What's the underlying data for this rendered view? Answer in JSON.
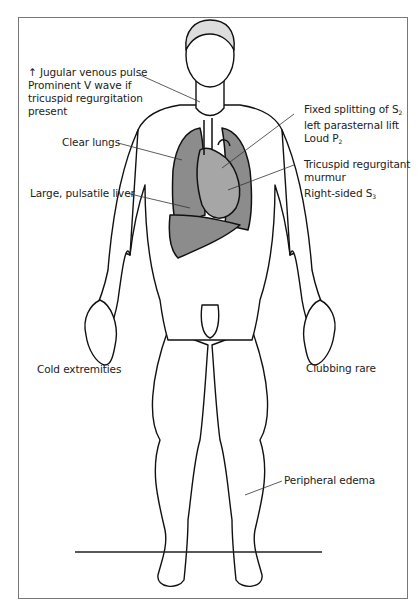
{
  "figure": {
    "colors": {
      "organ_fill": "#8c8c8c",
      "organ_fill_light": "#a6a6a6",
      "outline": "#111111",
      "body_fill": "#ffffff",
      "frame": "#777777"
    },
    "labels": {
      "jvp": {
        "arrow": "↑",
        "line1": "Jugular venous pulse",
        "line2": "Prominent V wave if",
        "line3": "tricuspid regurgitation",
        "line4": "present"
      },
      "lungs": "Clear lungs",
      "liver": "Large, pulsatile liver",
      "splitting": {
        "line1": "Fixed splitting of S",
        "line1_sub": "2",
        "line2": "left parasternal lift",
        "line3": "Loud P",
        "line3_sub": "2"
      },
      "murmur": {
        "line1": "Tricuspid regurgitant",
        "line2": "murmur",
        "line3": "Right-sided S",
        "line3_sub": "3"
      },
      "cold": "Cold extremities",
      "clubbing": "Clubbing rare",
      "edema": "Peripheral edema"
    }
  }
}
